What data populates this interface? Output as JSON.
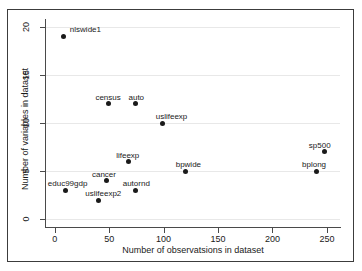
{
  "chart_data": {
    "type": "scatter",
    "title": "",
    "xlabel": "Number of observatsions in dataset",
    "ylabel": "Number of variables in dataset",
    "xlim": [
      -8,
      262
    ],
    "ylim": [
      -0.8,
      20.8
    ],
    "xticks": [
      0,
      50,
      100,
      150,
      200,
      250
    ],
    "yticks": [
      0,
      5,
      10,
      15,
      20
    ],
    "xtick_labels": [
      "0",
      "50",
      "100",
      "150",
      "200",
      "250"
    ],
    "ytick_labels": [
      "0",
      "5",
      "10",
      "15",
      "20"
    ],
    "grid": "horizontal",
    "legend": "none",
    "marker_color": "#1a1a1a",
    "grid_color": "#e8e8e8",
    "axis_color": "#4a4a4a",
    "background_color": "#ffffff",
    "points": [
      {
        "label": "nlswide1",
        "x": 8,
        "y": 19,
        "label_dx": 22,
        "label_dy": -11
      },
      {
        "label": "census",
        "x": 49,
        "y": 12,
        "label_dx": 0,
        "label_dy": -11
      },
      {
        "label": "auto",
        "x": 74,
        "y": 12,
        "label_dx": 1,
        "label_dy": -11
      },
      {
        "label": "uslifeexp",
        "x": 99,
        "y": 10,
        "label_dx": 9,
        "label_dy": -11
      },
      {
        "label": "sp500",
        "x": 248,
        "y": 7,
        "label_dx": -5,
        "label_dy": -11
      },
      {
        "label": "lifeexp",
        "x": 68,
        "y": 6,
        "label_dx": -1,
        "label_dy": -11
      },
      {
        "label": "bpwide",
        "x": 120,
        "y": 5,
        "label_dx": 3,
        "label_dy": -11
      },
      {
        "label": "bplong",
        "x": 240,
        "y": 5,
        "label_dx": -2,
        "label_dy": -11
      },
      {
        "label": "cancer",
        "x": 48,
        "y": 4,
        "label_dx": -3,
        "label_dy": -11
      },
      {
        "label": "educ99gdp",
        "x": 10,
        "y": 3,
        "label_dx": 2,
        "label_dy": -11
      },
      {
        "label": "autornd",
        "x": 74,
        "y": 3,
        "label_dx": 1,
        "label_dy": -11
      },
      {
        "label": "uslifeexp2",
        "x": 40,
        "y": 2,
        "label_dx": 5,
        "label_dy": -11
      }
    ]
  }
}
